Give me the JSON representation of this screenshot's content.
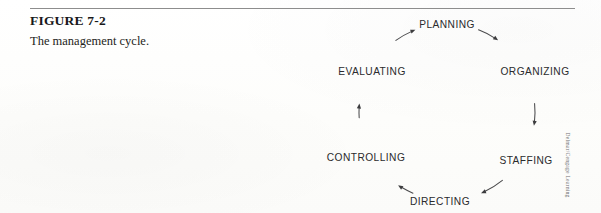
{
  "figure": {
    "number": "FIGURE 7-2",
    "title": "The management cycle."
  },
  "credit": {
    "text": "Delmar/Cengage Learning"
  },
  "colors": {
    "background": "#fdfdfc",
    "rule": "#8d8d8d",
    "caption_text": "#18181a",
    "label_text": "#2b2b2d",
    "arc_stroke": "#4a4a4c",
    "credit_text": "#6f6f72"
  },
  "chart_data": {
    "type": "diagram",
    "diagram_kind": "cycle",
    "title": "The management cycle.",
    "direction": "clockwise",
    "node_count": 6,
    "center": {
      "x": 117,
      "y": 107
    },
    "radius": 88,
    "nodes": [
      {
        "label": "PLANNING",
        "angle_deg": 270,
        "position": "top",
        "x": 117,
        "y": 19,
        "anchor": "middle"
      },
      {
        "label": "ORGANIZING",
        "angle_deg": 330,
        "position": "upper-right",
        "x": 205,
        "y": 66,
        "anchor": "middle"
      },
      {
        "label": "STAFFING",
        "angle_deg": 30,
        "position": "lower-right",
        "x": 196,
        "y": 155,
        "anchor": "middle"
      },
      {
        "label": "DIRECTING",
        "angle_deg": 90,
        "position": "bottom",
        "x": 110,
        "y": 196,
        "anchor": "middle"
      },
      {
        "label": "CONTROLLING",
        "angle_deg": 150,
        "position": "lower-left",
        "x": 36,
        "y": 152,
        "anchor": "middle"
      },
      {
        "label": "EVALUATING",
        "angle_deg": 210,
        "position": "upper-left",
        "x": 42,
        "y": 66,
        "anchor": "middle"
      }
    ],
    "edges": [
      {
        "from": "PLANNING",
        "to": "ORGANIZING",
        "arrow": "to"
      },
      {
        "from": "ORGANIZING",
        "to": "STAFFING",
        "arrow": "to"
      },
      {
        "from": "STAFFING",
        "to": "DIRECTING",
        "arrow": "to"
      },
      {
        "from": "DIRECTING",
        "to": "CONTROLLING",
        "arrow": "to"
      },
      {
        "from": "CONTROLLING",
        "to": "EVALUATING",
        "arrow": "to"
      },
      {
        "from": "EVALUATING",
        "to": "PLANNING",
        "arrow": "to"
      }
    ]
  }
}
